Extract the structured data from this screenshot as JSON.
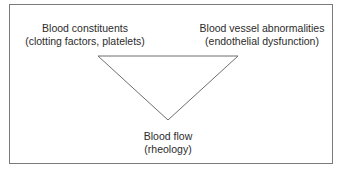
{
  "diagram": {
    "type": "triangle",
    "nodes": [
      {
        "id": "blood-constituents",
        "position": "top-left",
        "title": "Blood constituents",
        "subtitle": "(clotting factors, platelets)"
      },
      {
        "id": "blood-vessel-abnormalities",
        "position": "top-right",
        "title": "Blood vessel abnormalities",
        "subtitle": "(endothelial dysfunction)"
      },
      {
        "id": "blood-flow",
        "position": "bottom",
        "title": "Blood flow",
        "subtitle": "(rheology)"
      }
    ],
    "edges": [
      [
        "blood-constituents",
        "blood-vessel-abnormalities"
      ],
      [
        "blood-constituents",
        "blood-flow"
      ],
      [
        "blood-vessel-abnormalities",
        "blood-flow"
      ]
    ],
    "colors": {
      "line": "#6e6e6e",
      "border": "#7a7a7a",
      "text": "#2b2b2b",
      "background": "#ffffff"
    }
  }
}
